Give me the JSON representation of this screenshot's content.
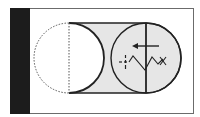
{
  "diagram": {
    "colors": {
      "background": "#ffffff",
      "frame": "#6b6b6b",
      "side_bar": "#1c1c1c",
      "capsule_fill": "#e6e6e6",
      "stroke": "#222222",
      "dashed": "#555555"
    },
    "elements": {
      "side_bar": "black-bar",
      "left_circle": "dashed-circle",
      "capsule_body": "shaded-capsule",
      "right_circle": "solid-circle",
      "arrow": "left-arrow-icon",
      "spring": "zigzag-spring",
      "crosshair": "crosshair-mark",
      "x_mark": "x-mark"
    }
  }
}
